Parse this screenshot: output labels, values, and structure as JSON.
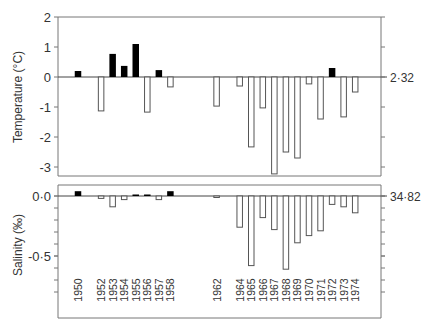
{
  "chart_data": [
    {
      "type": "bar",
      "panel": "top",
      "title": "",
      "ylabel": "Temperature (°C)",
      "right_reference_label": "2·32",
      "ylim": [
        -3.4,
        2.0
      ],
      "yticks": [
        2,
        1,
        0,
        -1,
        -2,
        -3
      ],
      "ytick_labels": [
        "2",
        "1",
        "0",
        "-1",
        "-2",
        "-3"
      ],
      "grid": false,
      "legend": null,
      "categories": [
        "1950",
        "1952",
        "1953",
        "1954",
        "1955",
        "1956",
        "1957",
        "1958",
        "1962",
        "1964",
        "1965",
        "1966",
        "1967",
        "1968",
        "1969",
        "1970",
        "1971",
        "1972",
        "1973",
        "1974"
      ],
      "values": [
        0.2,
        -1.13,
        0.77,
        0.37,
        1.1,
        -1.17,
        0.23,
        -0.33,
        -0.97,
        -0.3,
        -2.33,
        -1.03,
        -3.23,
        -2.5,
        -2.7,
        -0.23,
        -1.4,
        0.3,
        -1.33,
        -0.5
      ],
      "style_note": "positive anomalies drawn as filled black bars, negative as open bars"
    },
    {
      "type": "bar",
      "panel": "bottom",
      "title": "",
      "ylabel": "Salinity (‰)",
      "right_reference_label": "34·82",
      "ylim": [
        -0.85,
        0.1
      ],
      "yticks": [
        0.0,
        -0.5
      ],
      "ytick_labels": [
        "0·0",
        "-0·5"
      ],
      "minor_tick_step": 0.1,
      "grid": false,
      "legend": null,
      "categories": [
        "1950",
        "1952",
        "1953",
        "1954",
        "1955",
        "1956",
        "1957",
        "1958",
        "1962",
        "1964",
        "1965",
        "1966",
        "1967",
        "1968",
        "1969",
        "1970",
        "1971",
        "1972",
        "1973",
        "1974"
      ],
      "values": [
        0.04,
        -0.02,
        -0.09,
        -0.03,
        0.01,
        0.01,
        -0.03,
        0.04,
        -0.01,
        -0.26,
        -0.58,
        -0.18,
        -0.28,
        -0.61,
        -0.39,
        -0.33,
        -0.29,
        -0.07,
        -0.09,
        -0.14
      ],
      "xlabel": "",
      "style_note": "positive anomalies drawn as filled black bars, negative as open bars"
    }
  ],
  "labels": {
    "temp_axis": "Temperature (°C)",
    "sal_axis_prefix": "Salinity (",
    "sal_axis_unit": "‰",
    "sal_axis_suffix": ")",
    "temp_ref": "2·32",
    "sal_ref": "34·82"
  },
  "colors": {
    "axis": "#777777",
    "positive_fill": "#000000",
    "negative_stroke": "#555555",
    "text": "#333333"
  }
}
